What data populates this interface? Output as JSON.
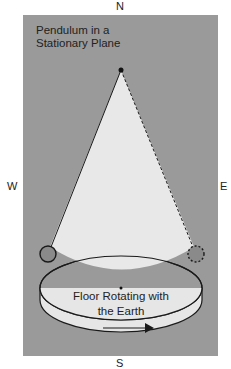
{
  "compass": {
    "north": "N",
    "west": "W",
    "east": "E",
    "south": "S"
  },
  "title": {
    "line1": "Pendulum in a",
    "line2": "Stationary Plane"
  },
  "floor": {
    "line1": "Floor Rotating with",
    "line2": "the Earth"
  },
  "colors": {
    "background": "#9a9a9a",
    "cone": "#e8e8e8",
    "floor": "#e6e6e6",
    "bob": "#8a8a8a",
    "stroke": "#1a1a1a"
  }
}
